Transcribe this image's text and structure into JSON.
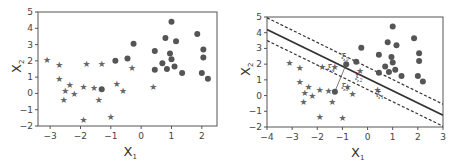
{
  "chart_data": [
    {
      "type": "scatter",
      "title": "",
      "xlabel": "X1",
      "ylabel": "X2",
      "xlim": [
        -3.4,
        2.5
      ],
      "ylim": [
        -2,
        5
      ],
      "xticks": [
        -3,
        -2,
        -1,
        0,
        1,
        2
      ],
      "yticks": [
        -2,
        -1,
        0,
        1,
        2,
        3,
        4,
        5
      ],
      "grid": false,
      "legend": null,
      "series": [
        {
          "name": "stars",
          "marker": "star",
          "points": [
            [
              -3.1,
              2.1
            ],
            [
              -2.7,
              1.8
            ],
            [
              -2.7,
              0.9
            ],
            [
              -2.35,
              0.55
            ],
            [
              -2.5,
              0.2
            ],
            [
              -2.55,
              -0.4
            ],
            [
              -2.2,
              0.0
            ],
            [
              -1.9,
              0.4
            ],
            [
              -1.8,
              1.85
            ],
            [
              -1.55,
              0.35
            ],
            [
              -1.3,
              1.85
            ],
            [
              -1.4,
              -0.4
            ],
            [
              -0.8,
              0.6
            ],
            [
              -0.6,
              0.15
            ],
            [
              -0.3,
              1.6
            ],
            [
              0.4,
              0.4
            ],
            [
              -1.9,
              -1.6
            ],
            [
              -1.0,
              -1.4
            ]
          ]
        },
        {
          "name": "circles",
          "marker": "circle",
          "points": [
            [
              -0.85,
              2.0
            ],
            [
              -1.3,
              0.25
            ],
            [
              -0.45,
              2.15
            ],
            [
              -0.25,
              3.05
            ],
            [
              0.45,
              2.6
            ],
            [
              0.45,
              1.45
            ],
            [
              0.7,
              1.85
            ],
            [
              0.8,
              3.4
            ],
            [
              0.85,
              1.5
            ],
            [
              0.95,
              2.45
            ],
            [
              1.0,
              4.4
            ],
            [
              1.0,
              2.1
            ],
            [
              1.1,
              1.65
            ],
            [
              1.15,
              3.2
            ],
            [
              1.35,
              1.25
            ],
            [
              1.85,
              3.65
            ],
            [
              2.0,
              1.25
            ],
            [
              2.05,
              2.2
            ],
            [
              2.05,
              2.7
            ],
            [
              2.2,
              0.9
            ]
          ]
        }
      ]
    },
    {
      "type": "scatter",
      "title": "",
      "xlabel": "X1",
      "ylabel": "X2",
      "xlim": [
        -4,
        3
      ],
      "ylim": [
        -2,
        5
      ],
      "xticks": [
        -4,
        -3,
        -2,
        -1,
        0,
        1,
        2,
        3
      ],
      "yticks": [
        -2,
        -1,
        0,
        1,
        2,
        3,
        4,
        5
      ],
      "grid": false,
      "legend": null,
      "lines": [
        {
          "name": "hyperplane",
          "style": "solid",
          "from": [
            -4,
            4.2
          ],
          "to": [
            3,
            -1.25
          ]
        },
        {
          "name": "upper-margin",
          "style": "dashed",
          "from": [
            -4,
            4.95
          ],
          "to": [
            3,
            -0.55
          ]
        },
        {
          "name": "lower-margin",
          "style": "dashed",
          "from": [
            -4,
            3.5
          ],
          "to": [
            3,
            -1.95
          ]
        }
      ],
      "annotations": [
        {
          "text": "ξ",
          "sub": "1",
          "x": 0.35,
          "y": -0.1
        },
        {
          "text": "ξ",
          "sub": "2",
          "x": -0.5,
          "y": 1.0
        },
        {
          "text": "ξ",
          "sub": "3",
          "x": -1.05,
          "y": 0.4
        },
        {
          "text": "ξ",
          "sub": "4",
          "x": -1.6,
          "y": 1.65
        },
        {
          "text": "ξ",
          "sub": "5",
          "x": -1.05,
          "y": 2.3
        }
      ],
      "slack_segments": [
        {
          "from": [
            -1.3,
            0.25
          ],
          "to": [
            -0.85,
            2.0
          ]
        }
      ],
      "series": [
        {
          "name": "stars",
          "marker": "star",
          "points": [
            [
              -3.1,
              2.1
            ],
            [
              -2.7,
              1.8
            ],
            [
              -2.7,
              0.9
            ],
            [
              -2.35,
              0.55
            ],
            [
              -2.5,
              0.2
            ],
            [
              -2.55,
              -0.4
            ],
            [
              -2.2,
              0.0
            ],
            [
              -1.9,
              0.4
            ],
            [
              -1.8,
              1.85
            ],
            [
              -1.55,
              0.35
            ],
            [
              -1.3,
              1.85
            ],
            [
              -1.4,
              -0.4
            ],
            [
              -0.8,
              0.6
            ],
            [
              -0.6,
              0.15
            ],
            [
              -0.3,
              1.6
            ],
            [
              0.4,
              0.4
            ],
            [
              -1.9,
              -1.3
            ],
            [
              -1.0,
              -1.4
            ]
          ]
        },
        {
          "name": "circles",
          "marker": "circle",
          "points": [
            [
              -0.85,
              2.0
            ],
            [
              -1.3,
              0.25
            ],
            [
              -0.45,
              2.15
            ],
            [
              -0.25,
              3.05
            ],
            [
              0.45,
              2.6
            ],
            [
              0.45,
              1.45
            ],
            [
              0.7,
              1.85
            ],
            [
              0.8,
              3.4
            ],
            [
              0.85,
              1.5
            ],
            [
              0.95,
              2.45
            ],
            [
              1.0,
              4.4
            ],
            [
              1.0,
              2.1
            ],
            [
              1.1,
              1.65
            ],
            [
              1.15,
              3.2
            ],
            [
              1.35,
              1.25
            ],
            [
              1.85,
              3.65
            ],
            [
              2.0,
              1.25
            ],
            [
              2.05,
              2.2
            ],
            [
              2.05,
              2.7
            ],
            [
              2.2,
              0.9
            ]
          ]
        }
      ]
    }
  ],
  "labels": {
    "x_axis_main": "X",
    "x_axis_sub": "1",
    "y_axis_main": "X",
    "y_axis_sub": "2"
  }
}
